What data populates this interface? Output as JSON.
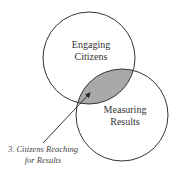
{
  "diagram": {
    "type": "venn",
    "circles": [
      {
        "label_lines": [
          "Engaging",
          "Citizens"
        ],
        "cx": 89,
        "cy": 58,
        "r": 46
      },
      {
        "label_lines": [
          "Measuring",
          "Results"
        ],
        "cx": 122,
        "cy": 115,
        "r": 46
      }
    ],
    "intersection": {
      "fill": "#a9a9a9"
    },
    "callout": {
      "lines": [
        "3. Citizens Reaching",
        "for Results"
      ],
      "arrow_from": [
        43,
        143
      ],
      "arrow_to": [
        91,
        92
      ]
    },
    "colors": {
      "stroke": "#333333",
      "overlap_fill": "#a9a9a9",
      "background": "#ffffff"
    }
  }
}
